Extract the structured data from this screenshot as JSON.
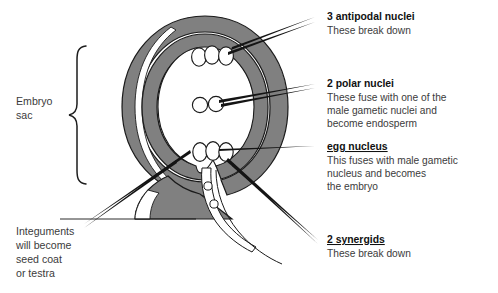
{
  "figure": {
    "title_visible": false,
    "background_color": "#ffffff"
  },
  "colors": {
    "integument_gray": "#808080",
    "integument_gray_dark": "#6e6e6e",
    "funiculus_gray": "#808080",
    "outline": "#1a1a1a",
    "heading_text": "#111111",
    "body_text": "#3b3b3b",
    "embryo_sac_fill": "#ffffff"
  },
  "left_labels": [
    {
      "id": "embryo-sac",
      "lines": [
        "Embryo",
        "sac"
      ],
      "has_brace": true
    },
    {
      "id": "integuments",
      "lines": [
        "Integuments",
        "will become",
        "seed coat",
        "or testra"
      ],
      "has_brace": false
    }
  ],
  "right_labels": [
    {
      "id": "antipodal-nuclei",
      "heading": "3 antipodal nuclei",
      "heading_underline": false,
      "body": [
        "These break down"
      ]
    },
    {
      "id": "polar-nuclei",
      "heading": "2 polar nuclei",
      "heading_underline": false,
      "body": [
        "These fuse with one of the",
        "male gametic nuclei and",
        "become endosperm"
      ]
    },
    {
      "id": "egg-nucleus",
      "heading": "egg nucleus",
      "heading_underline": true,
      "body": [
        "This fuses with male gametic",
        "nucleus and becomes",
        "the embryo"
      ]
    },
    {
      "id": "synergids",
      "heading": "2 synergids",
      "heading_underline": true,
      "body": [
        "These break down"
      ]
    }
  ],
  "structures": {
    "antipodal_nuclei_count": 3,
    "polar_nuclei_count": 2,
    "egg_apparatus_count": 3,
    "micropyle_nuclei_count": 2,
    "integument_layers": 2,
    "diagram_type": "ovule-embryo-sac-cross-section"
  },
  "icons": {
    "brace": "curly-brace-icon",
    "leader": "leader-line-icon"
  }
}
